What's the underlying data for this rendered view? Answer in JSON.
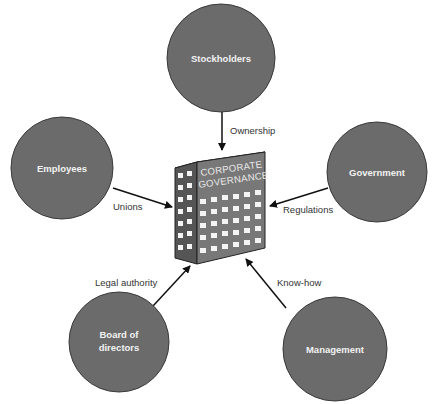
{
  "diagram": {
    "center": {
      "label_line1": "CORPORATE",
      "label_line2": "GOVERNANCE",
      "icon": "office-building-icon"
    },
    "nodes": [
      {
        "id": "stockholders",
        "label": "Stockholders",
        "edge_label": "Ownership"
      },
      {
        "id": "employees",
        "label": "Employees",
        "edge_label": "Unions"
      },
      {
        "id": "government",
        "label": "Government",
        "edge_label": "Regulations"
      },
      {
        "id": "board",
        "label_line1": "Board of",
        "label_line2": "directors",
        "edge_label": "Legal authority"
      },
      {
        "id": "management",
        "label": "Management",
        "edge_label": "Know-how"
      }
    ],
    "colors": {
      "node_fill": "#6b6b6b",
      "node_stroke": "#3a3a3a",
      "arrow": "#111111",
      "building_side": "#555555",
      "building_front": "#777777",
      "window": "#f4f4f4"
    }
  }
}
